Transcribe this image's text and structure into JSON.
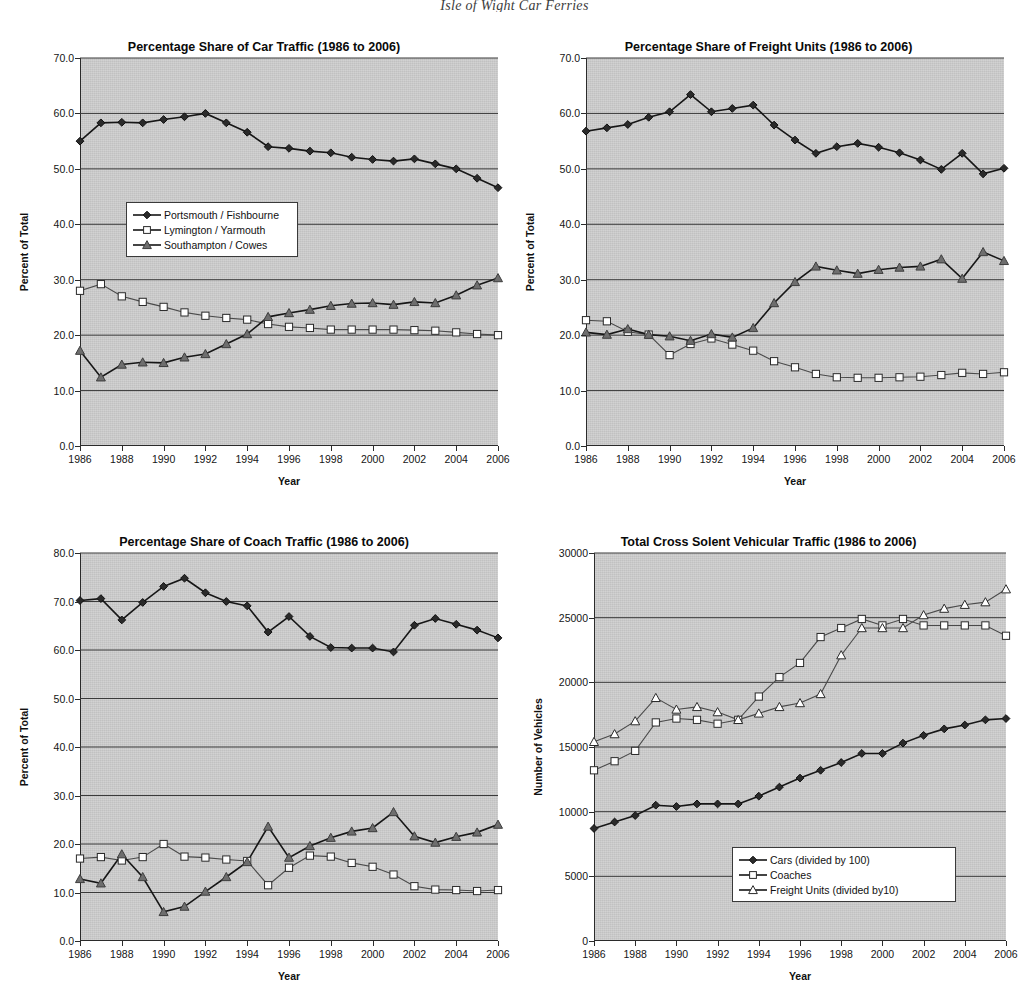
{
  "page": {
    "heading": "Isle of Wight Car Ferries"
  },
  "common": {
    "xlabel": "Year",
    "ylabel_percent": "Percent of Total",
    "ylabel_vehicles": "Number of Vehicles",
    "years": [
      1986,
      1987,
      1988,
      1989,
      1990,
      1991,
      1992,
      1993,
      1994,
      1995,
      1996,
      1997,
      1998,
      1999,
      2000,
      2001,
      2002,
      2003,
      2004,
      2005,
      2006
    ],
    "xticks": [
      "1986",
      "1988",
      "1990",
      "1992",
      "1994",
      "1996",
      "1998",
      "2000",
      "2002",
      "2004",
      "2006"
    ],
    "colors": {
      "plot_background": "#c9c9c9",
      "axis": "#2b2b2b",
      "gridline": "#3a3a3a",
      "series_dark": "#2a2a2a",
      "series_open": "#ffffff",
      "series_gray": "#6e6e6e"
    }
  },
  "chart_data": [
    {
      "id": "car-traffic",
      "type": "line",
      "title": "Percentage Share of Car Traffic (1986 to 2006)",
      "xlabel": "Year",
      "ylabel": "Percent of Total",
      "x": [
        1986,
        1987,
        1988,
        1989,
        1990,
        1991,
        1992,
        1993,
        1994,
        1995,
        1996,
        1997,
        1998,
        1999,
        2000,
        2001,
        2002,
        2003,
        2004,
        2005,
        2006
      ],
      "ylim": [
        0.0,
        70.0
      ],
      "yticks": [
        "0.0",
        "10.0",
        "20.0",
        "30.0",
        "40.0",
        "50.0",
        "60.0",
        "70.0"
      ],
      "grid": true,
      "legend_position": "inside-left",
      "series": [
        {
          "name": "Portsmouth / Fishbourne",
          "marker": "diamond",
          "fill": "dark",
          "values": [
            55.0,
            58.3,
            58.4,
            58.3,
            58.9,
            59.4,
            60.0,
            58.3,
            56.6,
            54.0,
            53.7,
            53.2,
            52.9,
            52.1,
            51.7,
            51.4,
            51.8,
            50.9,
            50.0,
            48.3,
            46.6
          ]
        },
        {
          "name": "Lymington / Yarmouth",
          "marker": "square",
          "fill": "open",
          "values": [
            28.0,
            29.2,
            27.0,
            26.0,
            25.1,
            24.1,
            23.5,
            23.1,
            22.8,
            22.0,
            21.5,
            21.3,
            21.0,
            21.0,
            21.0,
            21.0,
            20.9,
            20.8,
            20.5,
            20.2,
            20.0
          ]
        },
        {
          "name": "Southampton / Cowes",
          "marker": "triangle",
          "fill": "gray",
          "values": [
            17.2,
            12.4,
            14.7,
            15.1,
            15.0,
            16.0,
            16.6,
            18.4,
            20.2,
            23.3,
            24.0,
            24.6,
            25.3,
            25.7,
            25.8,
            25.5,
            26.0,
            25.8,
            27.2,
            29.0,
            30.3
          ]
        }
      ]
    },
    {
      "id": "freight-units",
      "type": "line",
      "title": "Percentage Share of Freight Units (1986 to 2006)",
      "xlabel": "Year",
      "ylabel": "Percent of Total",
      "x": [
        1986,
        1987,
        1988,
        1989,
        1990,
        1991,
        1992,
        1993,
        1994,
        1995,
        1996,
        1997,
        1998,
        1999,
        2000,
        2001,
        2002,
        2003,
        2004,
        2005,
        2006
      ],
      "ylim": [
        0.0,
        70.0
      ],
      "yticks": [
        "0.0",
        "10.0",
        "20.0",
        "30.0",
        "40.0",
        "50.0",
        "60.0",
        "70.0"
      ],
      "grid": true,
      "legend_position": "none",
      "series": [
        {
          "name": "Portsmouth / Fishbourne",
          "marker": "diamond",
          "fill": "dark",
          "values": [
            56.8,
            57.4,
            58.0,
            59.3,
            60.3,
            63.4,
            60.3,
            60.9,
            61.5,
            57.9,
            55.2,
            52.8,
            54.0,
            54.6,
            53.9,
            52.9,
            51.6,
            49.9,
            52.8,
            49.1,
            50.1
          ]
        },
        {
          "name": "Lymington / Yarmouth",
          "marker": "square",
          "fill": "open",
          "values": [
            22.7,
            22.5,
            20.6,
            20.1,
            16.4,
            18.4,
            19.4,
            18.3,
            17.2,
            15.3,
            14.2,
            13.0,
            12.4,
            12.3,
            12.3,
            12.4,
            12.5,
            12.8,
            13.2,
            13.0,
            13.3
          ]
        },
        {
          "name": "Southampton / Cowes",
          "marker": "triangle",
          "fill": "gray",
          "values": [
            20.5,
            20.1,
            21.1,
            20.1,
            19.8,
            19.0,
            20.2,
            19.6,
            21.3,
            25.8,
            29.6,
            32.4,
            31.7,
            31.1,
            31.8,
            32.2,
            32.4,
            33.7,
            30.2,
            35.0,
            33.4
          ]
        }
      ]
    },
    {
      "id": "coach-traffic",
      "type": "line",
      "title": "Percentage Share of Coach Traffic (1986 to 2006)",
      "xlabel": "Year",
      "ylabel": "Percent of Total",
      "x": [
        1986,
        1987,
        1988,
        1989,
        1990,
        1991,
        1992,
        1993,
        1994,
        1995,
        1996,
        1997,
        1998,
        1999,
        2000,
        2001,
        2002,
        2003,
        2004,
        2005,
        2006
      ],
      "ylim": [
        0.0,
        80.0
      ],
      "yticks": [
        "0.0",
        "10.0",
        "20.0",
        "30.0",
        "40.0",
        "50.0",
        "60.0",
        "70.0",
        "80.0"
      ],
      "grid": true,
      "legend_position": "none",
      "series": [
        {
          "name": "Portsmouth / Fishbourne",
          "marker": "diamond",
          "fill": "dark",
          "values": [
            70.2,
            70.6,
            66.2,
            69.8,
            73.1,
            74.8,
            71.8,
            70.0,
            69.1,
            63.7,
            66.9,
            62.8,
            60.5,
            60.4,
            60.4,
            59.6,
            65.1,
            66.5,
            65.3,
            64.1,
            62.5
          ]
        },
        {
          "name": "Lymington / Yarmouth",
          "marker": "square",
          "fill": "open",
          "values": [
            17.0,
            17.3,
            16.6,
            17.3,
            20.0,
            17.4,
            17.2,
            16.8,
            16.5,
            11.5,
            15.1,
            17.6,
            17.4,
            16.1,
            15.3,
            13.7,
            11.3,
            10.6,
            10.5,
            10.3,
            10.5
          ]
        },
        {
          "name": "Southampton / Cowes",
          "marker": "triangle",
          "fill": "gray",
          "values": [
            12.8,
            11.9,
            17.9,
            13.2,
            6.0,
            7.1,
            10.2,
            13.2,
            16.3,
            23.6,
            17.2,
            19.6,
            21.3,
            22.6,
            23.3,
            26.6,
            21.6,
            20.3,
            21.5,
            22.4,
            24.0
          ]
        }
      ]
    },
    {
      "id": "total-traffic",
      "type": "line",
      "title": "Total Cross Solent Vehicular Traffic (1986 to 2006)",
      "xlabel": "Year",
      "ylabel": "Number of Vehicles",
      "x": [
        1986,
        1987,
        1988,
        1989,
        1990,
        1991,
        1992,
        1993,
        1994,
        1995,
        1996,
        1997,
        1998,
        1999,
        2000,
        2001,
        2002,
        2003,
        2004,
        2005,
        2006
      ],
      "ylim": [
        0,
        30000
      ],
      "yticks": [
        "0",
        "5000",
        "10000",
        "15000",
        "20000",
        "25000",
        "30000"
      ],
      "grid": true,
      "legend_position": "inside-bottom-right",
      "series": [
        {
          "name": "Cars (divided by 100)",
          "marker": "diamond",
          "fill": "dark",
          "values": [
            8700,
            9200,
            9700,
            10500,
            10400,
            10600,
            10600,
            10600,
            11200,
            11900,
            12600,
            13200,
            13800,
            14500,
            14500,
            15300,
            15900,
            16400,
            16700,
            17100,
            17200
          ]
        },
        {
          "name": "Coaches",
          "marker": "square",
          "fill": "open",
          "values": [
            13200,
            13900,
            14700,
            16900,
            17200,
            17100,
            16800,
            17100,
            18900,
            20400,
            21500,
            23500,
            24200,
            24900,
            24400,
            24900,
            24400,
            24400,
            24400,
            24400,
            23600
          ]
        },
        {
          "name": "Freight Units (divided by10)",
          "marker": "triangle",
          "fill": "open",
          "values": [
            15400,
            16000,
            17000,
            18800,
            17900,
            18100,
            17700,
            17100,
            17600,
            18100,
            18400,
            19100,
            22100,
            24200,
            24200,
            24200,
            25200,
            25700,
            26000,
            26200,
            27200
          ]
        }
      ]
    }
  ],
  "legends": {
    "chart1": [
      {
        "label": "Portsmouth / Fishbourne",
        "marker": "diamond",
        "fill": "dark"
      },
      {
        "label": "Lymington / Yarmouth",
        "marker": "square",
        "fill": "open"
      },
      {
        "label": "Southampton / Cowes",
        "marker": "triangle",
        "fill": "gray"
      }
    ],
    "chart4": [
      {
        "label": "Cars (divided by 100)",
        "marker": "diamond",
        "fill": "dark"
      },
      {
        "label": "Coaches",
        "marker": "square",
        "fill": "open"
      },
      {
        "label": "Freight Units (divided by10)",
        "marker": "triangle",
        "fill": "open"
      }
    ]
  }
}
